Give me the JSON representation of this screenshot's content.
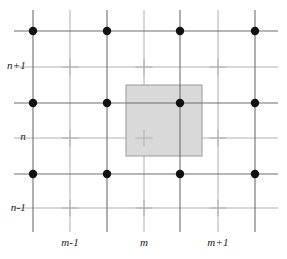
{
  "figure": {
    "type": "staggered-grid-diagram",
    "title": "",
    "width": 287,
    "height": 259,
    "background_color": "#ffffff"
  },
  "style": {
    "major_line_color": "#6e6e6e",
    "minor_line_color": "#b0b0b0",
    "node_color": "#111111",
    "node_radius": 4.2,
    "cell_fill": "#d9d9d9",
    "cell_stroke": "#9a9a9a",
    "major_line_width": 1.1,
    "minor_line_width": 1.0,
    "cross_arm": 8.5
  },
  "grid": {
    "major_x": [
      33,
      107,
      180,
      255
    ],
    "major_y": [
      31,
      103,
      174
    ],
    "minor_x": [
      70,
      144,
      218
    ],
    "minor_y": [
      67,
      138,
      208
    ],
    "extent_x": [
      14,
      278
    ],
    "extent_y": [
      10,
      232
    ]
  },
  "nodes": [
    {
      "name": "node-m-1-n-1",
      "x": 33,
      "y": 31
    },
    {
      "name": "node-m-n-1",
      "x": 107,
      "y": 31
    },
    {
      "name": "node-m1-n-1",
      "x": 180,
      "y": 31
    },
    {
      "name": "node-m2-n-1",
      "x": 255,
      "y": 31
    },
    {
      "name": "node-m-1-n",
      "x": 33,
      "y": 103
    },
    {
      "name": "node-m-n",
      "x": 107,
      "y": 103
    },
    {
      "name": "node-m1-n",
      "x": 180,
      "y": 103
    },
    {
      "name": "node-m2-n",
      "x": 255,
      "y": 103
    },
    {
      "name": "node-m-1-nm1",
      "x": 33,
      "y": 174
    },
    {
      "name": "node-m-nm1",
      "x": 107,
      "y": 174
    },
    {
      "name": "node-m1-nm1",
      "x": 180,
      "y": 174
    },
    {
      "name": "node-m2-nm1",
      "x": 255,
      "y": 174
    }
  ],
  "crosses": [
    {
      "x": 70,
      "y": 67
    },
    {
      "x": 144,
      "y": 67
    },
    {
      "x": 218,
      "y": 67
    },
    {
      "x": 70,
      "y": 138
    },
    {
      "x": 144,
      "y": 138
    },
    {
      "x": 218,
      "y": 138
    },
    {
      "x": 70,
      "y": 208
    },
    {
      "x": 144,
      "y": 208
    },
    {
      "x": 218,
      "y": 208
    }
  ],
  "highlight_cell": {
    "name": "control-volume",
    "x": 126,
    "y": 85,
    "width": 76,
    "height": 71,
    "fill": "#d9d9d9",
    "stroke": "#9a9a9a"
  },
  "labels": {
    "y_axis": [
      {
        "text": "n+1",
        "x": 26,
        "y": 66
      },
      {
        "text": "n",
        "x": 26,
        "y": 137
      },
      {
        "text": "n-1",
        "x": 26,
        "y": 208
      }
    ],
    "x_axis": [
      {
        "text": "m-1",
        "x": 70,
        "y": 243
      },
      {
        "text": "m",
        "x": 144,
        "y": 243
      },
      {
        "text": "m+1",
        "x": 218,
        "y": 243
      }
    ]
  }
}
